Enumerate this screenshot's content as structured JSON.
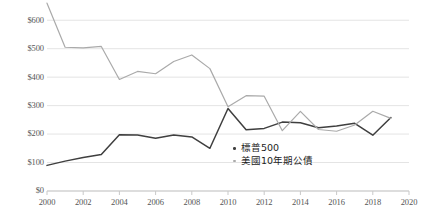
{
  "chart_data": {
    "type": "line",
    "title": "",
    "subtitle": "",
    "xlabel": "",
    "ylabel": "",
    "xlim": [
      2000,
      2020
    ],
    "ylim": [
      0,
      650
    ],
    "y_tick_values": [
      0,
      100,
      200,
      300,
      400,
      500,
      600
    ],
    "y_tick_labels": [
      "$0",
      "$100",
      "$200",
      "$300",
      "$400",
      "$500",
      "$600"
    ],
    "x_tick_values": [
      2000,
      2002,
      2004,
      2006,
      2008,
      2010,
      2012,
      2014,
      2016,
      2018,
      2020
    ],
    "x_tick_labels": [
      "2000",
      "2002",
      "2004",
      "2006",
      "2008",
      "2010",
      "2012",
      "2014",
      "2016",
      "2018",
      "2020"
    ],
    "grid": true,
    "grid_axis": "y",
    "legend_position": "inside-right-lower",
    "x": [
      2000,
      2001,
      2002,
      2003,
      2004,
      2005,
      2006,
      2007,
      2008,
      2009,
      2010,
      2011,
      2012,
      2013,
      2014,
      2015,
      2016,
      2017,
      2018,
      2019
    ],
    "series": [
      {
        "name": "標普500",
        "color": "#3f3f3f",
        "values": [
          90,
          105,
          118,
          128,
          198,
          197,
          185,
          197,
          190,
          150,
          290,
          215,
          220,
          242,
          240,
          222,
          228,
          238,
          196,
          258
        ]
      },
      {
        "name": "美國10年期公債",
        "color": "#aaaaaa",
        "values": [
          660,
          505,
          503,
          508,
          392,
          420,
          412,
          455,
          478,
          430,
          296,
          335,
          333,
          212,
          280,
          216,
          210,
          232,
          280,
          255
        ]
      }
    ]
  },
  "legend": {
    "items": [
      {
        "label": "標普500",
        "color": "#3f3f3f"
      },
      {
        "label": "美國10年期公債",
        "color": "#aaaaaa"
      }
    ]
  }
}
